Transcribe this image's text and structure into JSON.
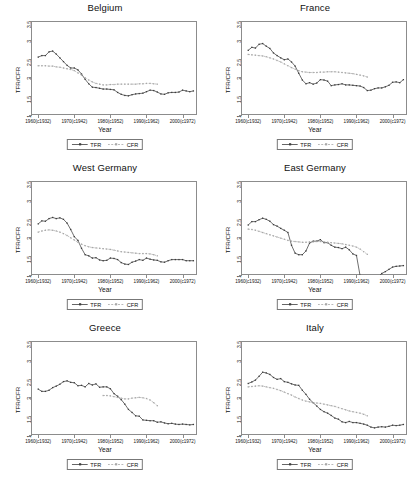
{
  "figure": {
    "axis": {
      "ylabel": "TFR/CFR",
      "xlabel": "Year",
      "yticks": [
        "1",
        "1.5",
        "2",
        "2.5",
        "3",
        "3.5"
      ],
      "ylim": [
        1,
        3.5
      ],
      "xticks": [
        "1960(c1932)",
        "1970(c1942)",
        "1980(c1952)",
        "1990(c1962)",
        "2000(c1972)"
      ],
      "xtick_values": [
        1960,
        1970,
        1980,
        1990,
        2000
      ],
      "xlim": [
        1958,
        2004
      ],
      "grid": false
    },
    "legend": {
      "position": "below-axis",
      "entries": [
        {
          "label": "TFR",
          "style": "solid",
          "marker": "square",
          "color": "#3d3d3d"
        },
        {
          "label": "CFR",
          "style": "dashed",
          "marker": "square",
          "color": "#a8a8a8"
        }
      ]
    },
    "colors": {
      "tfr": "#3d3d3d",
      "cfr": "#a8a8a8",
      "frame": "#8c8c8c",
      "text": "#111111",
      "background": "#ffffff"
    }
  },
  "chart_data": [
    {
      "type": "line",
      "title": "Belgium",
      "xlabel": "Year",
      "ylabel": "TFR/CFR",
      "ylim": [
        1,
        3.5
      ],
      "xlim": [
        1958,
        2004
      ],
      "series": [
        {
          "name": "TFR",
          "x": [
            1960,
            1961,
            1962,
            1963,
            1964,
            1965,
            1966,
            1967,
            1968,
            1969,
            1970,
            1971,
            1972,
            1973,
            1974,
            1975,
            1976,
            1977,
            1978,
            1979,
            1980,
            1981,
            1982,
            1983,
            1984,
            1985,
            1986,
            1987,
            1988,
            1989,
            1990,
            1991,
            1992,
            1993,
            1994,
            1995,
            1996,
            1997,
            1998,
            1999,
            2000,
            2001,
            2002,
            2003
          ],
          "y": [
            2.54,
            2.58,
            2.58,
            2.68,
            2.7,
            2.62,
            2.52,
            2.42,
            2.32,
            2.25,
            2.25,
            2.2,
            2.09,
            1.95,
            1.83,
            1.74,
            1.73,
            1.71,
            1.69,
            1.69,
            1.68,
            1.67,
            1.6,
            1.55,
            1.52,
            1.51,
            1.54,
            1.56,
            1.57,
            1.58,
            1.62,
            1.66,
            1.65,
            1.61,
            1.56,
            1.55,
            1.59,
            1.6,
            1.6,
            1.61,
            1.66,
            1.64,
            1.62,
            1.64
          ]
        },
        {
          "name": "CFR",
          "x": [
            1960,
            1961,
            1962,
            1963,
            1964,
            1965,
            1966,
            1967,
            1968,
            1969,
            1970,
            1971,
            1972,
            1973,
            1974,
            1975,
            1976,
            1977,
            1978,
            1979,
            1980,
            1981,
            1982,
            1983,
            1984,
            1985,
            1986,
            1987,
            1988,
            1989,
            1990,
            1991,
            1992,
            1993
          ],
          "y": [
            2.31,
            2.31,
            2.31,
            2.3,
            2.3,
            2.28,
            2.27,
            2.25,
            2.23,
            2.21,
            2.18,
            2.12,
            2.06,
            1.99,
            1.93,
            1.88,
            1.84,
            1.82,
            1.8,
            1.8,
            1.81,
            1.81,
            1.82,
            1.82,
            1.82,
            1.82,
            1.82,
            1.82,
            1.83,
            1.83,
            1.84,
            1.84,
            1.83,
            1.82
          ]
        }
      ]
    },
    {
      "type": "line",
      "title": "France",
      "xlabel": "Year",
      "ylabel": "TFR/CFR",
      "ylim": [
        1,
        3.5
      ],
      "xlim": [
        1958,
        2004
      ],
      "series": [
        {
          "name": "TFR",
          "x": [
            1960,
            1961,
            1962,
            1963,
            1964,
            1965,
            1966,
            1967,
            1968,
            1969,
            1970,
            1971,
            1972,
            1973,
            1974,
            1975,
            1976,
            1977,
            1978,
            1979,
            1980,
            1981,
            1982,
            1983,
            1984,
            1985,
            1986,
            1987,
            1988,
            1989,
            1990,
            1991,
            1992,
            1993,
            1994,
            1995,
            1996,
            1997,
            1998,
            1999,
            2000,
            2001,
            2002,
            2003
          ],
          "y": [
            2.72,
            2.8,
            2.78,
            2.88,
            2.9,
            2.83,
            2.77,
            2.65,
            2.58,
            2.52,
            2.47,
            2.49,
            2.41,
            2.3,
            2.11,
            1.93,
            1.83,
            1.86,
            1.82,
            1.85,
            1.94,
            1.93,
            1.9,
            1.78,
            1.8,
            1.81,
            1.83,
            1.8,
            1.8,
            1.79,
            1.78,
            1.77,
            1.73,
            1.65,
            1.66,
            1.7,
            1.72,
            1.72,
            1.75,
            1.79,
            1.87,
            1.88,
            1.86,
            1.94
          ]
        },
        {
          "name": "CFR",
          "x": [
            1960,
            1961,
            1962,
            1963,
            1964,
            1965,
            1966,
            1967,
            1968,
            1969,
            1970,
            1971,
            1972,
            1973,
            1974,
            1975,
            1976,
            1977,
            1978,
            1979,
            1980,
            1981,
            1982,
            1983,
            1984,
            1985,
            1986,
            1987,
            1988,
            1989,
            1990,
            1991,
            1992,
            1993
          ],
          "y": [
            2.61,
            2.6,
            2.59,
            2.58,
            2.57,
            2.55,
            2.52,
            2.49,
            2.45,
            2.41,
            2.36,
            2.31,
            2.26,
            2.22,
            2.18,
            2.15,
            2.14,
            2.13,
            2.13,
            2.13,
            2.14,
            2.14,
            2.15,
            2.15,
            2.15,
            2.14,
            2.13,
            2.12,
            2.11,
            2.1,
            2.08,
            2.06,
            2.04,
            2.01
          ]
        }
      ]
    },
    {
      "type": "line",
      "title": "West Germany",
      "xlabel": "Year",
      "ylabel": "TFR/CFR",
      "ylim": [
        1,
        3.5
      ],
      "xlim": [
        1958,
        2004
      ],
      "series": [
        {
          "name": "TFR",
          "x": [
            1960,
            1961,
            1962,
            1963,
            1964,
            1965,
            1966,
            1967,
            1968,
            1969,
            1970,
            1971,
            1972,
            1973,
            1974,
            1975,
            1976,
            1977,
            1978,
            1979,
            1980,
            1981,
            1982,
            1983,
            1984,
            1985,
            1986,
            1987,
            1988,
            1989,
            1990,
            1991,
            1992,
            1993,
            1994,
            1995,
            1996,
            1997,
            1998,
            1999,
            2000,
            2001,
            2002,
            2003
          ],
          "y": [
            2.36,
            2.44,
            2.43,
            2.5,
            2.53,
            2.5,
            2.52,
            2.48,
            2.38,
            2.21,
            2.02,
            1.92,
            1.71,
            1.54,
            1.51,
            1.45,
            1.46,
            1.4,
            1.38,
            1.39,
            1.45,
            1.44,
            1.41,
            1.33,
            1.29,
            1.28,
            1.34,
            1.37,
            1.41,
            1.39,
            1.45,
            1.42,
            1.4,
            1.39,
            1.35,
            1.34,
            1.38,
            1.41,
            1.41,
            1.41,
            1.41,
            1.38,
            1.38,
            1.38
          ]
        },
        {
          "name": "CFR",
          "x": [
            1960,
            1961,
            1962,
            1963,
            1964,
            1965,
            1966,
            1967,
            1968,
            1969,
            1970,
            1971,
            1972,
            1973,
            1974,
            1975,
            1976,
            1977,
            1978,
            1979,
            1980,
            1981,
            1982,
            1983,
            1984,
            1985,
            1986,
            1987,
            1988,
            1989,
            1990,
            1991,
            1992,
            1993
          ],
          "y": [
            2.14,
            2.17,
            2.19,
            2.2,
            2.19,
            2.17,
            2.14,
            2.1,
            2.05,
            1.99,
            1.93,
            1.87,
            1.82,
            1.78,
            1.75,
            1.73,
            1.72,
            1.71,
            1.7,
            1.69,
            1.68,
            1.66,
            1.64,
            1.62,
            1.61,
            1.6,
            1.59,
            1.58,
            1.57,
            1.57,
            1.57,
            1.56,
            1.54,
            1.51
          ]
        }
      ]
    },
    {
      "type": "line",
      "title": "East Germany",
      "xlabel": "Year",
      "ylabel": "TFR/CFR",
      "ylim": [
        1,
        3.5
      ],
      "xlim": [
        1958,
        2004
      ],
      "series": [
        {
          "name": "TFR",
          "x": [
            1960,
            1961,
            1962,
            1963,
            1964,
            1965,
            1966,
            1967,
            1968,
            1969,
            1970,
            1971,
            1972,
            1973,
            1974,
            1975,
            1976,
            1977,
            1978,
            1979,
            1980,
            1981,
            1982,
            1983,
            1984,
            1985,
            1986,
            1987,
            1988,
            1989,
            1990,
            1991,
            1992,
            1993,
            1994,
            1995,
            1996,
            1997,
            1998,
            1999,
            2000,
            2001,
            2002,
            2003
          ],
          "y": [
            2.33,
            2.42,
            2.42,
            2.47,
            2.51,
            2.48,
            2.43,
            2.34,
            2.3,
            2.24,
            2.19,
            2.13,
            1.79,
            1.58,
            1.54,
            1.54,
            1.64,
            1.85,
            1.9,
            1.9,
            1.94,
            1.86,
            1.86,
            1.79,
            1.74,
            1.73,
            1.7,
            1.74,
            1.67,
            1.56,
            1.52,
            0.98,
            0.83,
            0.77,
            0.77,
            0.84,
            0.95,
            1.04,
            1.09,
            1.15,
            1.21,
            1.23,
            1.24,
            1.25
          ]
        },
        {
          "name": "CFR",
          "x": [
            1960,
            1961,
            1962,
            1963,
            1964,
            1965,
            1966,
            1967,
            1968,
            1969,
            1970,
            1971,
            1972,
            1973,
            1974,
            1975,
            1976,
            1977,
            1978,
            1979,
            1980,
            1981,
            1982,
            1983,
            1984,
            1985,
            1986,
            1987,
            1988,
            1989,
            1990,
            1991,
            1992,
            1993
          ],
          "y": [
            2.22,
            2.21,
            2.19,
            2.16,
            2.13,
            2.1,
            2.07,
            2.04,
            2.01,
            1.98,
            1.95,
            1.92,
            1.9,
            1.89,
            1.88,
            1.87,
            1.87,
            1.88,
            1.88,
            1.89,
            1.89,
            1.88,
            1.87,
            1.86,
            1.85,
            1.84,
            1.83,
            1.81,
            1.79,
            1.77,
            1.74,
            1.69,
            1.62,
            1.55
          ]
        }
      ]
    },
    {
      "type": "line",
      "title": "Greece",
      "xlabel": "Year",
      "ylabel": "TFR/CFR",
      "ylim": [
        1,
        3.5
      ],
      "xlim": [
        1958,
        2004
      ],
      "series": [
        {
          "name": "TFR",
          "x": [
            1960,
            1961,
            1962,
            1963,
            1964,
            1965,
            1966,
            1967,
            1968,
            1969,
            1970,
            1971,
            1972,
            1973,
            1974,
            1975,
            1976,
            1977,
            1978,
            1979,
            1980,
            1981,
            1982,
            1983,
            1984,
            1985,
            1986,
            1987,
            1988,
            1989,
            1990,
            1991,
            1992,
            1993,
            1994,
            1995,
            1996,
            1997,
            1998,
            1999,
            2000,
            2001,
            2002,
            2003
          ],
          "y": [
            2.22,
            2.16,
            2.16,
            2.19,
            2.26,
            2.3,
            2.35,
            2.42,
            2.44,
            2.4,
            2.39,
            2.31,
            2.32,
            2.28,
            2.37,
            2.33,
            2.36,
            2.27,
            2.28,
            2.28,
            2.23,
            2.1,
            2.03,
            1.94,
            1.82,
            1.68,
            1.6,
            1.51,
            1.5,
            1.4,
            1.39,
            1.38,
            1.38,
            1.34,
            1.35,
            1.32,
            1.3,
            1.31,
            1.29,
            1.28,
            1.29,
            1.28,
            1.27,
            1.28
          ]
        },
        {
          "name": "CFR",
          "x": [
            1978,
            1979,
            1980,
            1981,
            1982,
            1983,
            1984,
            1985,
            1986,
            1987,
            1988,
            1989,
            1990,
            1991,
            1992,
            1993
          ],
          "y": [
            2.05,
            2.05,
            2.04,
            2.02,
            2.0,
            1.98,
            1.96,
            1.96,
            1.98,
            1.99,
            2.0,
            1.99,
            1.97,
            1.93,
            1.86,
            1.78
          ]
        }
      ]
    },
    {
      "type": "line",
      "title": "Italy",
      "xlabel": "Year",
      "ylabel": "TFR/CFR",
      "ylim": [
        1,
        3.5
      ],
      "xlim": [
        1958,
        2004
      ],
      "series": [
        {
          "name": "TFR",
          "x": [
            1960,
            1961,
            1962,
            1963,
            1964,
            1965,
            1966,
            1967,
            1968,
            1969,
            1970,
            1971,
            1972,
            1973,
            1974,
            1975,
            1976,
            1977,
            1978,
            1979,
            1980,
            1981,
            1982,
            1983,
            1984,
            1985,
            1986,
            1987,
            1988,
            1989,
            1990,
            1991,
            1992,
            1993,
            1994,
            1995,
            1996,
            1997,
            1998,
            1999,
            2000,
            2001,
            2002,
            2003
          ],
          "y": [
            2.37,
            2.41,
            2.46,
            2.56,
            2.67,
            2.65,
            2.61,
            2.53,
            2.48,
            2.5,
            2.42,
            2.4,
            2.36,
            2.33,
            2.32,
            2.19,
            2.08,
            1.95,
            1.86,
            1.77,
            1.68,
            1.62,
            1.58,
            1.52,
            1.45,
            1.42,
            1.35,
            1.33,
            1.36,
            1.33,
            1.33,
            1.31,
            1.29,
            1.26,
            1.21,
            1.19,
            1.21,
            1.22,
            1.21,
            1.23,
            1.26,
            1.25,
            1.26,
            1.28
          ]
        },
        {
          "name": "CFR",
          "x": [
            1960,
            1961,
            1962,
            1963,
            1964,
            1965,
            1966,
            1967,
            1968,
            1969,
            1970,
            1971,
            1972,
            1973,
            1974,
            1975,
            1976,
            1977,
            1978,
            1979,
            1980,
            1981,
            1982,
            1983,
            1984,
            1985,
            1986,
            1987,
            1988,
            1989,
            1990,
            1991,
            1992,
            1993
          ],
          "y": [
            2.28,
            2.29,
            2.3,
            2.31,
            2.3,
            2.28,
            2.26,
            2.24,
            2.21,
            2.18,
            2.14,
            2.1,
            2.06,
            2.01,
            1.97,
            1.93,
            1.9,
            1.88,
            1.86,
            1.85,
            1.84,
            1.82,
            1.8,
            1.78,
            1.76,
            1.73,
            1.7,
            1.67,
            1.64,
            1.62,
            1.6,
            1.58,
            1.55,
            1.51
          ]
        }
      ]
    }
  ]
}
